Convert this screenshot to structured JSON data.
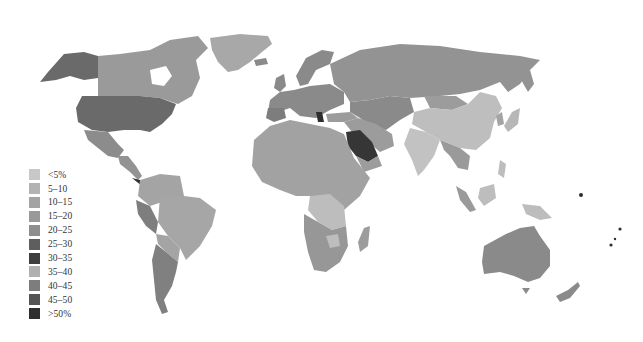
{
  "map": {
    "type": "choropleth-world",
    "projection": "miller-like",
    "background": "#ffffff",
    "colorscale": "greyscale"
  },
  "legend": {
    "items": [
      {
        "label": "<5%",
        "color": "#c8c8c8"
      },
      {
        "label": "5–10",
        "color": "#b3b3b3"
      },
      {
        "label": "10–15",
        "color": "#a3a3a3"
      },
      {
        "label": "15–20",
        "color": "#999999"
      },
      {
        "label": "20–25",
        "color": "#8e8e8e"
      },
      {
        "label": "25–30",
        "color": "#5e5e5e"
      },
      {
        "label": "30–35",
        "color": "#3e3e3e"
      },
      {
        "label": "35–40",
        "color": "#b0b0b0"
      },
      {
        "label": "40–45",
        "color": "#7d7d7d"
      },
      {
        "label": "45–50",
        "color": "#555555"
      },
      {
        "label": ">50%",
        "color": "#2e2e2e"
      }
    ]
  },
  "regions": {
    "usa": "#6a6a6a",
    "alaska": "#6a6a6a",
    "canada": "#9a9a9a",
    "greenland": "#a8a8a8",
    "mexico": "#8c8c8c",
    "central_america": "#939393",
    "south_america_north": "#a4a4a4",
    "peru": "#7e7e7e",
    "argentina": "#808080",
    "brazil": "#a6a6a6",
    "europe": "#8a8a8a",
    "russia": "#939393",
    "central_asia": "#8a8a8a",
    "middle_east": "#9c9c9c",
    "saudi_arabia": "#363636",
    "africa": "#a2a2a2",
    "central_africa": "#bdbdbd",
    "southern_africa": "#979797",
    "china": "#bebebe",
    "india": "#c2c2c2",
    "southeast_asia": "#9a9a9a",
    "indonesia": "#bdbdbd",
    "japan": "#b7b7b7",
    "australia": "#8a8a8a",
    "new_zealand": "#8a8a8a",
    "madagascar": "#9c9c9c",
    "pacific_islands_dark": "#2e2e2e"
  }
}
